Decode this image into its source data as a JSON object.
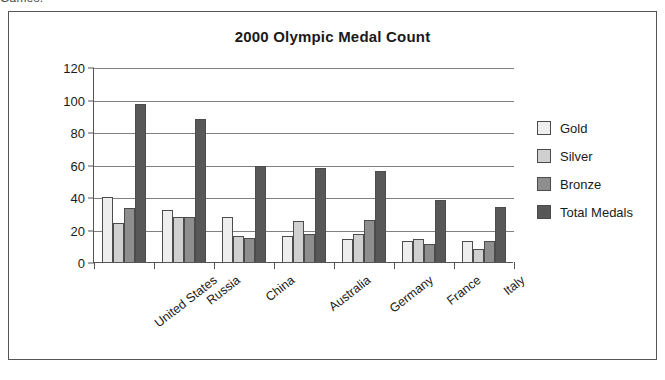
{
  "page": {
    "clipped_caption": "Games."
  },
  "chart_data": {
    "type": "bar",
    "title": "2000 Olympic Medal Count",
    "xlabel": "",
    "ylabel": "",
    "ylim": [
      0,
      120
    ],
    "yticks": [
      0,
      20,
      40,
      60,
      80,
      100,
      120
    ],
    "grid": true,
    "legend_position": "right",
    "categories": [
      "United States",
      "Russia",
      "China",
      "Australia",
      "Germany",
      "France",
      "Italy"
    ],
    "series": [
      {
        "name": "Gold",
        "color": "#eeeeee",
        "values": [
          40,
          32,
          28,
          16,
          14,
          13,
          13
        ]
      },
      {
        "name": "Silver",
        "color": "#d0d0d0",
        "values": [
          24,
          28,
          16,
          25,
          17,
          14,
          8
        ]
      },
      {
        "name": "Bronze",
        "color": "#8e8e8e",
        "values": [
          33,
          28,
          15,
          17,
          26,
          11,
          13
        ]
      },
      {
        "name": "Total Medals",
        "color": "#585858",
        "values": [
          97,
          88,
          59,
          58,
          56,
          38,
          34
        ]
      }
    ]
  }
}
